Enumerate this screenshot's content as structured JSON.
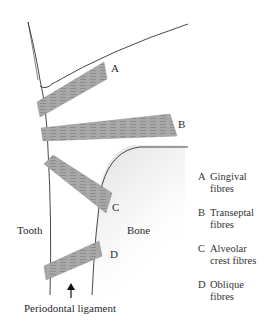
{
  "figure": {
    "labels": {
      "tooth": "Tooth",
      "bone": "Bone",
      "ligament": "Periodontal ligament"
    },
    "fibre_markers": [
      {
        "key": "A",
        "x": 111,
        "y": 63
      },
      {
        "key": "B",
        "x": 178,
        "y": 119
      },
      {
        "key": "C",
        "x": 111,
        "y": 201
      },
      {
        "key": "D",
        "x": 110,
        "y": 248
      }
    ],
    "legend": [
      {
        "key": "A",
        "line1": "Gingival",
        "line2": "fibres"
      },
      {
        "key": "B",
        "line1": "Transeptal",
        "line2": "fibres"
      },
      {
        "key": "C",
        "line1": "Alveolar",
        "line2": "crest fibres"
      },
      {
        "key": "D",
        "line1": "Oblique",
        "line2": "fibres"
      }
    ],
    "colors": {
      "tissue_fill": "#c8c8c8",
      "fibre_fill": "#a9a9a9",
      "outline": "#333333",
      "background": "#ffffff"
    }
  }
}
